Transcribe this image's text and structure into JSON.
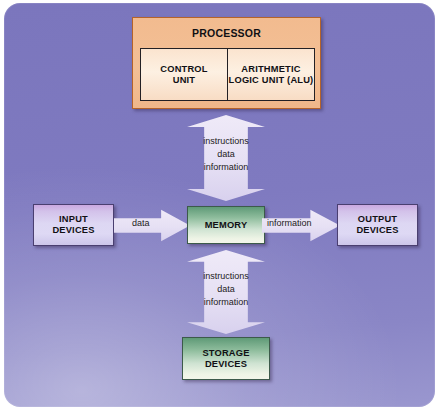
{
  "diagram": {
    "background_color": "#7f7ac0",
    "processor": {
      "title": "PROCESSOR",
      "accent_color": "#f2bb8f",
      "units": [
        {
          "name": "control-unit",
          "label": "CONTROL\nUNIT",
          "line1": "CONTROL",
          "line2": "UNIT"
        },
        {
          "name": "alu",
          "label": "ARITHMETIC LOGIC UNIT (ALU)",
          "line1": "ARITHMETIC",
          "line2": "LOGIC UNIT (ALU)"
        }
      ]
    },
    "nodes": {
      "input": {
        "line1": "INPUT",
        "line2": "DEVICES",
        "color": "#ddd7f3"
      },
      "output": {
        "line1": "OUTPUT",
        "line2": "DEVICES",
        "color": "#ddd7f3"
      },
      "memory": {
        "label": "MEMORY",
        "color": "#8fbd9d"
      },
      "storage": {
        "line1": "STORAGE",
        "line2": "DEVICES",
        "color": "#8fbd9d"
      }
    },
    "flows": {
      "input_to_memory": "data",
      "memory_to_output": "information",
      "processor_memory": {
        "line1": "instructions",
        "line2": "data",
        "line3": "information"
      },
      "memory_storage": {
        "line1": "instructions",
        "line2": "data",
        "line3": "information"
      }
    }
  }
}
